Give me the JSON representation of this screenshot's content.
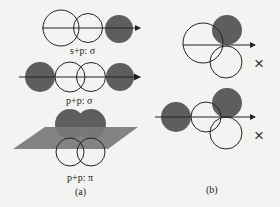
{
  "colors": {
    "filled": "#5e5e5e",
    "plane": "#7a7a7a",
    "stroke": "#222222",
    "background": "#f3f3f1"
  },
  "panel_a": {
    "label": "(a)",
    "rows": [
      {
        "label": "s+p: σ"
      },
      {
        "label": "p+p: σ"
      },
      {
        "label": "p+p: π"
      }
    ]
  },
  "panel_b": {
    "label": "(b)",
    "marks": [
      "×",
      "×"
    ]
  }
}
